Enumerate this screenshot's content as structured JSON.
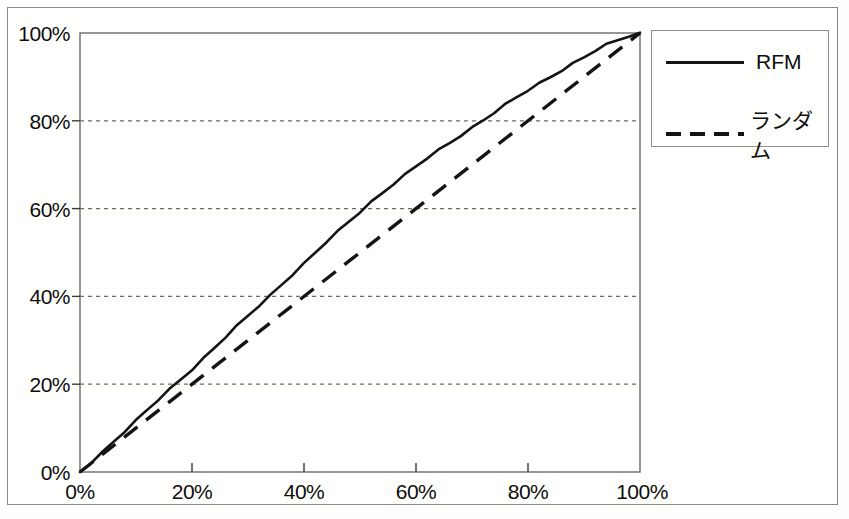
{
  "chart_data": {
    "type": "line",
    "title": "",
    "xlabel": "",
    "ylabel": "",
    "xlim": [
      0,
      100
    ],
    "ylim": [
      0,
      100
    ],
    "grid": "horizontal-dotted",
    "legend_position": "top-right",
    "x_ticks": [
      "0%",
      "20%",
      "40%",
      "60%",
      "80%",
      "100%"
    ],
    "y_ticks": [
      "0%",
      "20%",
      "40%",
      "60%",
      "80%",
      "100%"
    ],
    "x_tick_values": [
      0,
      20,
      40,
      60,
      80,
      100
    ],
    "y_tick_values": [
      0,
      20,
      40,
      60,
      80,
      100
    ],
    "series": [
      {
        "name": "RFM",
        "style": "solid",
        "color": "#141414",
        "x": [
          0,
          2,
          4,
          6,
          8,
          10,
          12,
          14,
          16,
          18,
          20,
          22,
          24,
          26,
          28,
          30,
          32,
          34,
          36,
          38,
          40,
          42,
          44,
          46,
          48,
          50,
          52,
          54,
          56,
          58,
          60,
          62,
          64,
          66,
          68,
          70,
          72,
          74,
          76,
          78,
          80,
          82,
          84,
          86,
          88,
          90,
          92,
          94,
          96,
          98,
          100
        ],
        "values": [
          0,
          2.3,
          4.6,
          7.0,
          9.3,
          11.6,
          14.0,
          16.4,
          18.8,
          21.2,
          23.5,
          25.9,
          28.3,
          30.7,
          33.1,
          35.5,
          37.9,
          40.3,
          42.8,
          45.2,
          47.5,
          49.9,
          52.3,
          54.6,
          57.0,
          59.3,
          61.6,
          63.7,
          65.7,
          67.6,
          69.5,
          71.4,
          73.2,
          75.0,
          76.8,
          78.5,
          80.2,
          81.9,
          83.6,
          85.3,
          86.9,
          88.5,
          90.1,
          91.6,
          93.1,
          94.5,
          95.9,
          97.2,
          98.3,
          99.3,
          100
        ]
      },
      {
        "name": "ランダム",
        "style": "dashed",
        "color": "#141414",
        "x": [
          0,
          100
        ],
        "values": [
          0,
          100
        ]
      }
    ],
    "annotations": [
      {
        "label": "RFM reaches 20% of responses at 18.5% of file"
      },
      {
        "label": "RFM reaches 40% of responses at 36% of file"
      },
      {
        "label": "RFM reaches 60% of responses at 53% of file"
      },
      {
        "label": "RFM reaches 80% of responses at 73% of file"
      }
    ]
  },
  "axes": {
    "y_labels": [
      "100%",
      "80%",
      "60%",
      "40%",
      "20%",
      "0%"
    ],
    "x_labels": [
      "0%",
      "20%",
      "40%",
      "60%",
      "80%",
      "100%"
    ]
  },
  "legend": {
    "items": [
      {
        "label": "RFM",
        "style": "solid"
      },
      {
        "label": "ランダム",
        "style": "dashed"
      }
    ]
  },
  "colors": {
    "line": "#141414",
    "grid": "#6e6e56",
    "frame": "#8a8a84",
    "background": "#fffffd"
  }
}
